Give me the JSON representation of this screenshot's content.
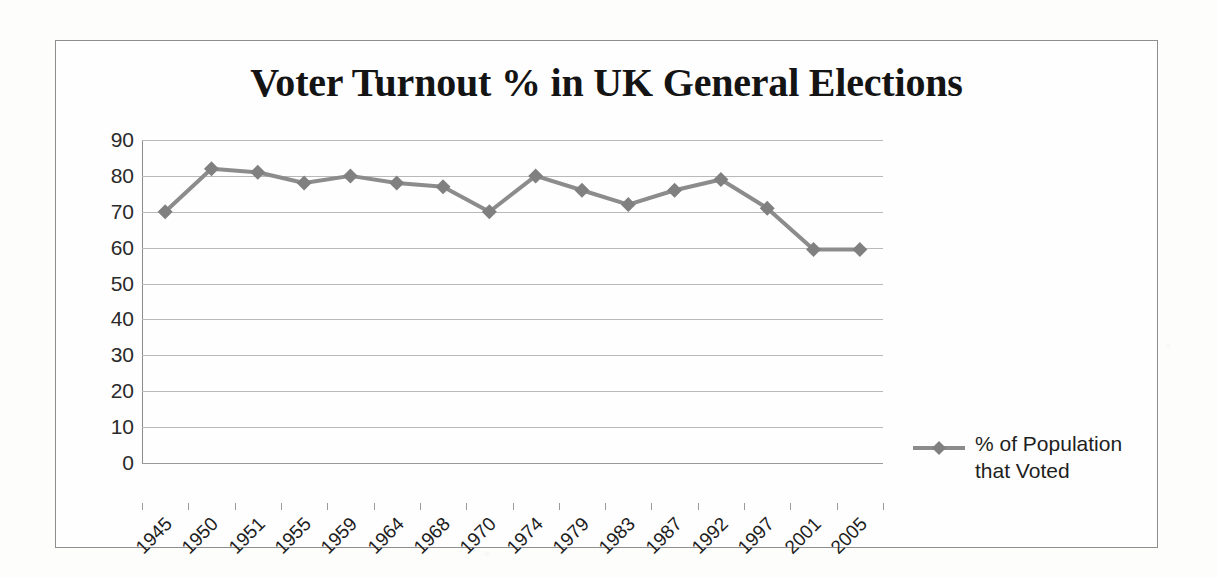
{
  "chart_data": {
    "type": "line",
    "title": "Voter Turnout % in UK General Elections",
    "xlabel": "",
    "ylabel": "",
    "ylim": [
      0,
      90
    ],
    "ytick_step": 10,
    "yticks": [
      90,
      80,
      70,
      60,
      50,
      40,
      30,
      20,
      10,
      0
    ],
    "grid": true,
    "legend_position": "right",
    "categories": [
      "1945",
      "1950",
      "1951",
      "1955",
      "1959",
      "1964",
      "1968",
      "1970",
      "1974",
      "1979",
      "1983",
      "1987",
      "1992",
      "1997",
      "2001",
      "2005"
    ],
    "series": [
      {
        "name": "% of Population that Voted",
        "values": [
          70,
          82,
          81,
          78,
          80,
          78,
          77,
          70,
          80,
          76,
          72,
          76,
          79,
          71,
          59.5,
          59.5
        ],
        "color": "#8c8c8c",
        "marker": "diamond",
        "marker_color": "#808080"
      }
    ]
  },
  "legend": {
    "label": "% of Population that Voted",
    "marker_name": "diamond-line-marker"
  },
  "colors": {
    "series": "#8c8c8c",
    "grid": "#b9b9b9",
    "axis": "#8c8c8c",
    "border": "#8e8e8e",
    "text": "#1d1d1d",
    "background": "#fefefe"
  }
}
